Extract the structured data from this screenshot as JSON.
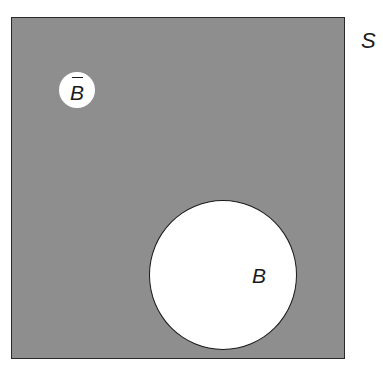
{
  "diagram": {
    "type": "venn",
    "sample_space": {
      "label": "S",
      "fill": "#8e8e8e"
    },
    "sets": [
      {
        "name": "B",
        "label": "B",
        "fill": "#ffffff"
      }
    ],
    "complement": {
      "name": "B-bar",
      "label": "B",
      "overline": true
    }
  },
  "colors": {
    "shaded_region": "#8e8e8e",
    "set_fill": "#ffffff",
    "stroke": "#1a1a1a"
  }
}
